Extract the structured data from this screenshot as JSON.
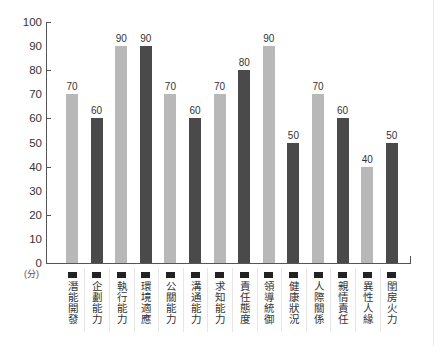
{
  "chart_data": {
    "type": "bar",
    "title": "",
    "xlabel": "",
    "ylabel": "(分)",
    "ylim": [
      0,
      100
    ],
    "yticks": [
      0,
      10,
      20,
      30,
      40,
      50,
      60,
      70,
      80,
      90,
      100
    ],
    "grid": false,
    "legend": "none",
    "categories": [
      "潛能開發",
      "企劃能力",
      "執行能力",
      "環境適應",
      "公關能力",
      "溝通能力",
      "求知能力",
      "責任態度",
      "領導統御",
      "健康狀況",
      "人際關係",
      "親情責任",
      "異性人緣",
      "閨房火力"
    ],
    "values": [
      70,
      60,
      90,
      90,
      70,
      60,
      70,
      80,
      90,
      50,
      70,
      60,
      40,
      50
    ],
    "bar_shades": [
      "light",
      "dark",
      "light",
      "dark",
      "light",
      "dark",
      "light",
      "dark",
      "light",
      "dark",
      "light",
      "dark",
      "light",
      "dark"
    ],
    "colors": {
      "light": "#b8b8b8",
      "dark": "#4a4a4a"
    }
  },
  "axis": {
    "y_labels": [
      "100",
      "90",
      "80",
      "70",
      "60",
      "50",
      "40",
      "30",
      "20",
      "10",
      "0"
    ],
    "unit": "(分)"
  },
  "value_labels": [
    "70",
    "60",
    "90",
    "90",
    "70",
    "60",
    "70",
    "80",
    "90",
    "50",
    "70",
    "60",
    "40",
    "50"
  ]
}
